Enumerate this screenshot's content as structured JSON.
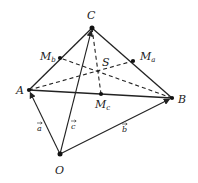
{
  "diagram": {
    "title": "",
    "points": [
      {
        "id": "A",
        "label": "A",
        "x": 29,
        "y": 90,
        "lx": 16,
        "ly": 94
      },
      {
        "id": "B",
        "label": "B",
        "x": 172,
        "y": 98,
        "lx": 178,
        "ly": 103
      },
      {
        "id": "C",
        "label": "C",
        "x": 92,
        "y": 28,
        "lx": 87,
        "ly": 19
      },
      {
        "id": "O",
        "label": "O",
        "x": 60,
        "y": 154,
        "lx": 55,
        "ly": 174
      },
      {
        "id": "Ma",
        "label": "M",
        "sub": "a",
        "x": 133,
        "y": 61,
        "lx": 140,
        "ly": 60
      },
      {
        "id": "Mb",
        "label": "M",
        "sub": "b",
        "x": 60,
        "y": 58,
        "lx": 40,
        "ly": 60
      },
      {
        "id": "Mc",
        "label": "M",
        "sub": "c",
        "x": 101,
        "y": 94,
        "lx": 95,
        "ly": 108
      },
      {
        "id": "S",
        "label": "S",
        "x": 99,
        "y": 71,
        "lx": 102,
        "ly": 66
      }
    ],
    "solid_edges": [
      [
        "A",
        "C"
      ],
      [
        "C",
        "B"
      ],
      [
        "A",
        "B"
      ]
    ],
    "vectors": [
      {
        "from": "O",
        "to": "A",
        "label": "a",
        "lx": 37,
        "ly": 131
      },
      {
        "from": "O",
        "to": "B",
        "label": "b",
        "lx": 122,
        "ly": 132
      },
      {
        "from": "O",
        "to": "C",
        "label": "c",
        "lx": 71,
        "ly": 129
      }
    ],
    "dashed_medians": [
      [
        "C",
        "Mc"
      ],
      [
        "A",
        "Ma"
      ],
      [
        "B",
        "Mb"
      ]
    ]
  }
}
